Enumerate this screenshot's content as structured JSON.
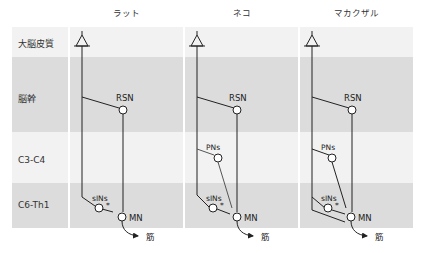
{
  "columns": [
    {
      "title": "ラット"
    },
    {
      "title": "ネコ"
    },
    {
      "title": "マカクザル"
    }
  ],
  "rows": [
    {
      "label": "大脳皮質",
      "color": "#f2f2f2"
    },
    {
      "label": "脳幹",
      "color": "#dcdcdc"
    },
    {
      "label": "C3-C4",
      "color": "#f2f2f2"
    },
    {
      "label": "C6-Th1",
      "color": "#dcdcdc"
    }
  ],
  "nodes": {
    "rsn": "RSN",
    "pns": "PNs",
    "sins": "sINs",
    "mn": "MN",
    "muscle": "筋",
    "star": "*"
  }
}
